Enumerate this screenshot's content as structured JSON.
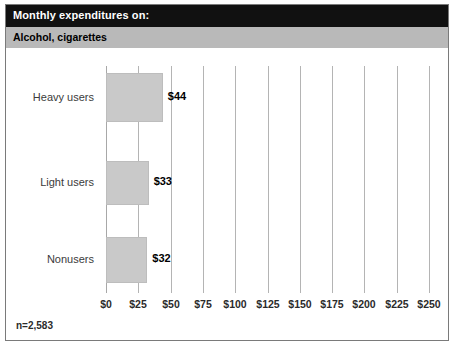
{
  "header": {
    "title": "Monthly expenditures on:",
    "subtitle": "Alcohol, cigarettes",
    "title_bg": "#111111",
    "subtitle_bg": "#b9b9b9"
  },
  "footnote": "n=2,583",
  "style": {
    "bar_fill": "#c9c9c9",
    "bar_stroke": "#bdbdbd",
    "gridline_color": "#b4b4b4",
    "frame_border": "#7a7a7a"
  },
  "chart_data": {
    "type": "bar",
    "orientation": "horizontal",
    "title": "Monthly expenditures on:",
    "subtitle": "Alcohol, cigarettes",
    "categories": [
      "Heavy users",
      "Light users",
      "Nonusers"
    ],
    "values": [
      44,
      33,
      32
    ],
    "data_labels": [
      "$44",
      "$33",
      "$32"
    ],
    "xlabel": "",
    "ylabel": "",
    "xlim": [
      0,
      250
    ],
    "xticks": [
      0,
      25,
      50,
      75,
      100,
      125,
      150,
      175,
      200,
      225,
      250
    ],
    "xtick_labels": [
      "$0",
      "$25",
      "$50",
      "$75",
      "$100",
      "$125",
      "$150",
      "$175",
      "$200",
      "$225",
      "$250"
    ],
    "grid": "vertical",
    "legend": "none",
    "sample_size": "n=2,583"
  }
}
